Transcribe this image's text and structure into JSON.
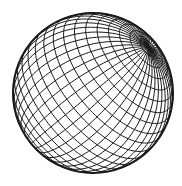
{
  "figure": {
    "type": "wireframe-sphere",
    "background": "#ffffff",
    "stroke_color": "#1a1a1a",
    "center": [
      93,
      93
    ],
    "radius": 80,
    "latitude_lines": 22,
    "longitude_lines": 22,
    "tilt_deg": -35,
    "pitch_deg": 30
  }
}
